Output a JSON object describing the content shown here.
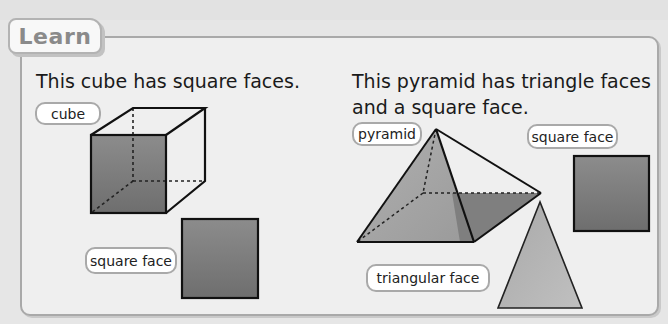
{
  "tab": {
    "label": "Learn"
  },
  "left_section": {
    "heading": "This cube has square faces.",
    "labels": {
      "cube": "cube",
      "square_face": "square face"
    }
  },
  "right_section": {
    "heading_line1": "This pyramid has triangle faces",
    "heading_line2": "and a square face.",
    "labels": {
      "pyramid": "pyramid",
      "square_face": "square face",
      "triangular_face": "triangular face"
    }
  },
  "colors": {
    "background": "#e6e6e6",
    "panel": "#efefef",
    "panel_border": "#a9a9a9",
    "face_dark": "#7a7a7a",
    "face_mid": "#a0a0a0",
    "face_light": "#b8b8b8"
  }
}
